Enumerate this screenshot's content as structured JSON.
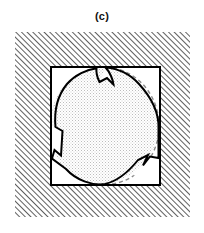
{
  "figure": {
    "panel_label": "(c)",
    "colors": {
      "background": "#ffffff",
      "hatch_line": "#2b2b2b",
      "outline": "#000000",
      "dashed_reference": "#8a8a8a",
      "stipple_dot": "#b9b9b9",
      "inner_fill": "#ffffff",
      "label_text": "#111111"
    },
    "outer_region": {
      "name": "hatched-matrix-region",
      "x": 15,
      "y": 32,
      "width": 175,
      "height": 185,
      "hatch_angle_deg": 45,
      "hatch_spacing_px": 4,
      "hatch_line_width_px": 1.4
    },
    "inner_square": {
      "name": "unit-cell-square",
      "x": 51,
      "y": 67,
      "width": 109,
      "height": 118,
      "stroke_width_px": 2
    },
    "inclusion": {
      "name": "deformed-circular-inclusion",
      "fill_pattern": "stipple-dots",
      "stroke_width_px": 2,
      "reference_circle": {
        "cx": 105,
        "cy": 126,
        "rx": 54,
        "ry": 59,
        "dash_pattern": "4 3"
      },
      "notch_count": 3,
      "notches": [
        {
          "id": "notch-top",
          "angle_deg": 72,
          "depth_px": 14
        },
        {
          "id": "notch-left",
          "angle_deg": 190,
          "depth_px": 12
        },
        {
          "id": "notch-bottom-right",
          "angle_deg": 330,
          "depth_px": 15
        }
      ]
    }
  }
}
